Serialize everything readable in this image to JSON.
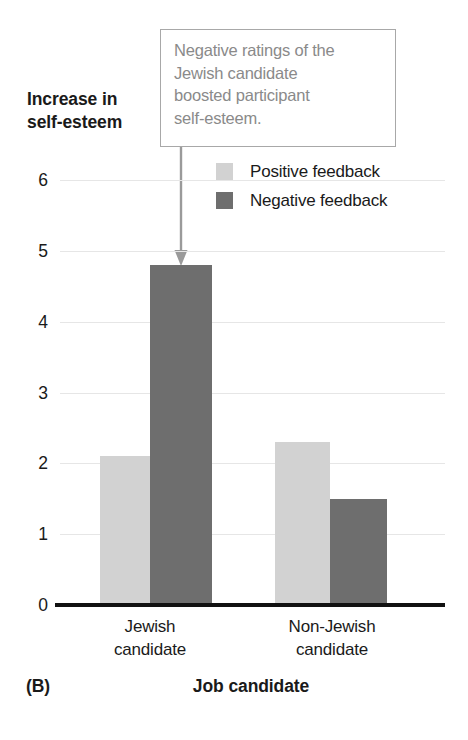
{
  "chart_data": {
    "type": "bar",
    "title": "",
    "panel_label": "(B)",
    "xlabel": "Job candidate",
    "ylabel_lines": [
      "Increase in",
      "self-esteem"
    ],
    "ylabel": "Increase in self-esteem",
    "categories": [
      "Jewish candidate",
      "Non-Jewish candidate"
    ],
    "category_lines": [
      [
        "Jewish",
        "candidate"
      ],
      [
        "Non-Jewish",
        "candidate"
      ]
    ],
    "series": [
      {
        "name": "Positive feedback",
        "color": "#d2d2d2",
        "values": [
          2.1,
          2.3
        ]
      },
      {
        "name": "Negative feedback",
        "color": "#6e6e6e",
        "values": [
          4.8,
          1.5
        ]
      }
    ],
    "ylim": [
      0,
      6
    ],
    "yticks": [
      0,
      1,
      2,
      3,
      4,
      5,
      6
    ],
    "ytick_labels": [
      "0",
      "1",
      "2",
      "3",
      "4",
      "5",
      "6"
    ],
    "grid": true,
    "grid_color": "#e6e6e6",
    "legend_position": "upper right",
    "annotations": [
      {
        "text": "Negative ratings of the Jewish candidate boosted participant self-esteem.",
        "lines": [
          "Negative ratings of the",
          "Jewish candidate",
          "boosted participant",
          "self-esteem."
        ],
        "text_color": "#8a8a8a",
        "border_color": "#a8a8a8",
        "points_to": {
          "category": "Jewish candidate",
          "series": "Negative feedback",
          "value": 4.8
        }
      }
    ]
  }
}
